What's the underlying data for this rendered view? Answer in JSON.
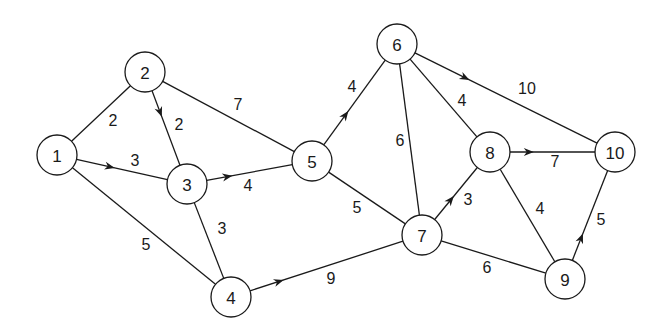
{
  "diagram": {
    "type": "weighted directed network graph",
    "nodes": [
      {
        "id": "1",
        "label": "1",
        "x": 57,
        "y": 155
      },
      {
        "id": "2",
        "label": "2",
        "x": 145,
        "y": 72
      },
      {
        "id": "3",
        "label": "3",
        "x": 187,
        "y": 184
      },
      {
        "id": "4",
        "label": "4",
        "x": 231,
        "y": 297
      },
      {
        "id": "5",
        "label": "5",
        "x": 312,
        "y": 161
      },
      {
        "id": "6",
        "label": "6",
        "x": 397,
        "y": 44
      },
      {
        "id": "7",
        "label": "7",
        "x": 422,
        "y": 235
      },
      {
        "id": "8",
        "label": "8",
        "x": 490,
        "y": 152
      },
      {
        "id": "9",
        "label": "9",
        "x": 565,
        "y": 279
      },
      {
        "id": "10",
        "label": "10",
        "x": 615,
        "y": 152
      }
    ],
    "edges": [
      {
        "from": "1",
        "to": "2",
        "weight": "2",
        "arrow": false,
        "label_x": 113,
        "label_y": 120
      },
      {
        "from": "1",
        "to": "3",
        "weight": "3",
        "arrow": true,
        "arrow_pos": 0.42,
        "label_x": 135,
        "label_y": 160
      },
      {
        "from": "1",
        "to": "4",
        "weight": "5",
        "arrow": false,
        "label_x": 146,
        "label_y": 244
      },
      {
        "from": "2",
        "to": "3",
        "weight": "2",
        "arrow": true,
        "arrow_pos": 0.35,
        "label_x": 179,
        "label_y": 124
      },
      {
        "from": "2",
        "to": "5",
        "weight": "7",
        "arrow": false,
        "label_x": 238,
        "label_y": 104
      },
      {
        "from": "3",
        "to": "5",
        "weight": "4",
        "arrow": true,
        "arrow_pos": 0.3,
        "label_x": 248,
        "label_y": 185
      },
      {
        "from": "3",
        "to": "4",
        "weight": "3",
        "arrow": false,
        "label_x": 222,
        "label_y": 228
      },
      {
        "from": "4",
        "to": "7",
        "weight": "9",
        "arrow": true,
        "arrow_pos": 0.22,
        "label_x": 331,
        "label_y": 278
      },
      {
        "from": "5",
        "to": "6",
        "weight": "4",
        "arrow": true,
        "arrow_pos": 0.4,
        "label_x": 352,
        "label_y": 86
      },
      {
        "from": "5",
        "to": "7",
        "weight": "5",
        "arrow": false,
        "label_x": 357,
        "label_y": 207
      },
      {
        "from": "6",
        "to": "7",
        "weight": "6",
        "arrow": false,
        "label_x": 400,
        "label_y": 140
      },
      {
        "from": "6",
        "to": "8",
        "weight": "4",
        "arrow": false,
        "label_x": 462,
        "label_y": 100
      },
      {
        "from": "6",
        "to": "10",
        "weight": "10",
        "arrow": true,
        "arrow_pos": 0.3,
        "label_x": 527,
        "label_y": 88
      },
      {
        "from": "7",
        "to": "8",
        "weight": "3",
        "arrow": true,
        "arrow_pos": 0.45,
        "label_x": 468,
        "label_y": 199
      },
      {
        "from": "7",
        "to": "9",
        "weight": "6",
        "arrow": false,
        "label_x": 487,
        "label_y": 267
      },
      {
        "from": "8",
        "to": "10",
        "weight": "7",
        "arrow": true,
        "arrow_pos": 0.28,
        "label_x": 555,
        "label_y": 161
      },
      {
        "from": "8",
        "to": "9",
        "weight": "4",
        "arrow": false,
        "label_x": 540,
        "label_y": 208
      },
      {
        "from": "9",
        "to": "10",
        "weight": "5",
        "arrow": true,
        "arrow_pos": 0.3,
        "label_x": 601,
        "label_y": 219
      }
    ],
    "colors": {
      "stroke": "#1a1a1a",
      "fill": "#ffffff",
      "background": "#ffffff"
    },
    "node_radius": 20
  }
}
